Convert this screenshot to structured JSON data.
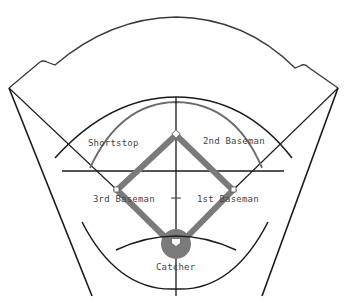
{
  "diagram": {
    "type": "baseball-field-positions",
    "positions": [
      {
        "id": "shortstop",
        "label": "Shortstop"
      },
      {
        "id": "second-baseman",
        "label": "2nd Baseman"
      },
      {
        "id": "third-baseman",
        "label": "3rd Baseman"
      },
      {
        "id": "first-baseman",
        "label": "1st Baseman"
      },
      {
        "id": "catcher",
        "label": "Catcher"
      }
    ],
    "colors": {
      "line": "#1a1a1a",
      "basepath": "#7a7a7a",
      "grass_arc": "#6b6b6b",
      "background": "#ffffff",
      "label": "#444444"
    }
  }
}
